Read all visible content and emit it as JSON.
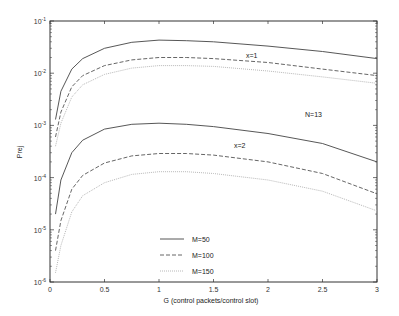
{
  "chart_data": {
    "type": "line",
    "title": "",
    "xlabel": "G (control packets/control slot)",
    "ylabel": "Prej",
    "xlim": [
      0,
      3
    ],
    "ylim": [
      1e-06,
      0.1
    ],
    "yscale": "log",
    "grid": false,
    "legend_position": "lower center inside",
    "x_ticks": [
      "0",
      "0.5",
      "1",
      "1.5",
      "2",
      "2.5",
      "3"
    ],
    "y_ticks": [
      "10^-6",
      "10^-5",
      "10^-4",
      "10^-3",
      "10^-2",
      "10^-1"
    ],
    "annotations": [
      "x=1",
      "x=2",
      "N=13"
    ],
    "x": [
      0.05,
      0.1,
      0.2,
      0.3,
      0.5,
      0.75,
      1.0,
      1.25,
      1.5,
      2.0,
      2.5,
      3.0
    ],
    "series": [
      {
        "name": "M=50",
        "group": "x=1",
        "style": "solid",
        "values": [
          0.0013,
          0.0045,
          0.012,
          0.019,
          0.03,
          0.039,
          0.043,
          0.042,
          0.04,
          0.033,
          0.026,
          0.019
        ]
      },
      {
        "name": "M=100",
        "group": "x=1",
        "style": "dashed",
        "values": [
          0.0006,
          0.0018,
          0.0055,
          0.009,
          0.014,
          0.018,
          0.02,
          0.02,
          0.019,
          0.016,
          0.012,
          0.009
        ]
      },
      {
        "name": "M=150",
        "group": "x=1",
        "style": "dotted",
        "values": [
          0.0004,
          0.0011,
          0.0035,
          0.006,
          0.0095,
          0.0125,
          0.014,
          0.014,
          0.0135,
          0.011,
          0.0085,
          0.0064
        ]
      },
      {
        "name": "M=50",
        "group": "x=2",
        "style": "solid",
        "values": [
          2e-05,
          9e-05,
          0.0003,
          0.00052,
          0.00085,
          0.00105,
          0.0011,
          0.00105,
          0.00095,
          0.0007,
          0.00045,
          0.0002
        ]
      },
      {
        "name": "M=100",
        "group": "x=2",
        "style": "dashed",
        "values": [
          4e-06,
          1.5e-05,
          6e-05,
          0.00011,
          0.00019,
          0.00026,
          0.00029,
          0.00029,
          0.00027,
          0.0002,
          0.00012,
          4.9e-05
        ]
      },
      {
        "name": "M=150",
        "group": "x=2",
        "style": "dotted",
        "values": [
          1.5e-06,
          5e-06,
          2.2e-05,
          4.5e-05,
          8e-05,
          0.000115,
          0.00013,
          0.00013,
          0.00012,
          9e-05,
          5.5e-05,
          2.3e-05
        ]
      }
    ]
  },
  "legend": {
    "items": [
      {
        "label": "M=50",
        "style": "solid"
      },
      {
        "label": "M=100",
        "style": "dashed"
      },
      {
        "label": "M=150",
        "style": "dotted"
      }
    ]
  },
  "labels": {
    "xlabel": "G (control packets/control slot)",
    "ylabel": "Prej",
    "annot_x1": "x=1",
    "annot_x2": "x=2",
    "annot_n": "N=13"
  },
  "colors": {
    "m50": "#444444",
    "m100": "#555555",
    "m150": "#b0b0b0",
    "axis": "#333333"
  }
}
